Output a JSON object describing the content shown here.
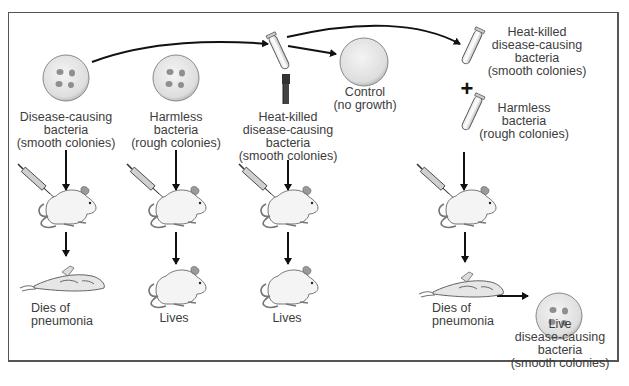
{
  "diagram": {
    "columns": [
      {
        "id": "col1",
        "source_label": [
          "Disease-causing",
          "bacteria",
          "(smooth colonies)"
        ],
        "outcome_label": [
          "Dies of",
          "pneumonia"
        ]
      },
      {
        "id": "col2",
        "source_label": [
          "Harmless",
          "bacteria",
          "(rough colonies)"
        ],
        "outcome_label": [
          "Lives"
        ]
      },
      {
        "id": "col3",
        "source_label": [
          "Heat-killed",
          "disease-causing",
          "bacteria",
          "(smooth colonies)"
        ],
        "control_label": [
          "Control",
          "(no growth)"
        ],
        "outcome_label": [
          "Lives"
        ]
      },
      {
        "id": "col4",
        "source_a_label": [
          "Heat-killed",
          "disease-causing",
          "bacteria",
          "(smooth colonies)"
        ],
        "plus_symbol": "+",
        "source_b_label": [
          "Harmless",
          "bacteria",
          "(rough colonies)"
        ],
        "outcome_label": [
          "Dies of",
          "pneumonia"
        ],
        "result_label": [
          "Live",
          "disease-causing",
          "bacteria",
          "(smooth colonies)"
        ]
      }
    ],
    "icons": [
      "petri-dish-icon",
      "test-tube-icon",
      "bunsen-burner-icon",
      "syringe-icon",
      "live-mouse-icon",
      "dead-mouse-icon",
      "arrow-icon"
    ],
    "colors": {
      "line": "#111111",
      "text": "#3c3c3c",
      "dish_fill": "#e9e9e9",
      "frame": "#555555"
    }
  }
}
